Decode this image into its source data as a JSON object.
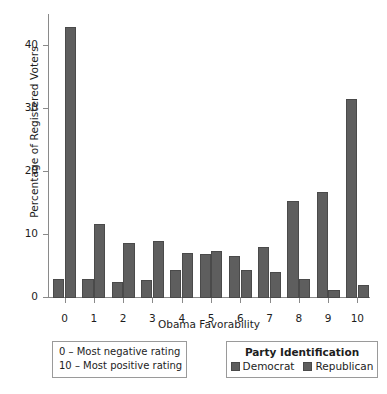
{
  "chart_data": {
    "type": "bar",
    "title": "",
    "xlabel": "Obama Favorability",
    "ylabel": "Percentage of Registered Voters",
    "categories": [
      "0",
      "1",
      "2",
      "3",
      "4",
      "5",
      "6",
      "7",
      "8",
      "9",
      "10"
    ],
    "series": [
      {
        "name": "Democrat",
        "color": "#5e5e5e",
        "values": [
          3.0,
          3.0,
          2.6,
          2.9,
          4.5,
          7.0,
          6.6,
          8.1,
          15.3,
          16.8,
          31.5
        ]
      },
      {
        "name": "Republican",
        "color": "#5e5e5e",
        "values": [
          42.9,
          11.7,
          8.7,
          9.1,
          7.2,
          7.5,
          4.4,
          4.1,
          3.0,
          1.2,
          2.0
        ]
      }
    ],
    "ylim": [
      0,
      45
    ],
    "yticks": [
      0,
      10,
      20,
      30,
      40
    ],
    "ytick_labels": [
      "0",
      "10",
      "20",
      "30",
      "40"
    ],
    "grid": false,
    "legend_position": "bottom-right"
  },
  "notes": {
    "lines": [
      "0 – Most negative rating",
      "10 – Most positive rating"
    ]
  },
  "legend": {
    "title": "Party Identification",
    "items": [
      {
        "label": "Democrat",
        "color": "#5e5e5e"
      },
      {
        "label": "Republican",
        "color": "#5e5e5e"
      }
    ]
  }
}
